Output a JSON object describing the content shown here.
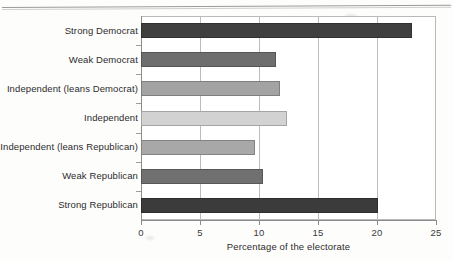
{
  "page": {
    "has_top_rule": true,
    "background_color": "#fdfdfc"
  },
  "chart_data": {
    "type": "bar",
    "orientation": "horizontal",
    "title": "",
    "subtitle": "",
    "xlabel": "Percentage of the electorate",
    "ylabel": "",
    "xlim": [
      0,
      25
    ],
    "xticks": [
      0,
      5,
      10,
      15,
      20,
      25
    ],
    "xtick_labels": [
      "0",
      "5",
      "10",
      "15",
      "20",
      "25"
    ],
    "grid": "vertical",
    "legend": "none",
    "categories": [
      "Strong Democrat",
      "Weak Democrat",
      "Independent (leans Democrat)",
      "Independent",
      "Independent (leans Republican)",
      "Weak Republican",
      "Strong Republican"
    ],
    "values": [
      23.0,
      11.4,
      11.8,
      12.4,
      9.7,
      10.3,
      20.1
    ],
    "bar_colors": [
      "#3f3f3f",
      "#6e6e6e",
      "#a3a3a3",
      "#d2d2d2",
      "#a8a8a8",
      "#707070",
      "#3b3b3b"
    ]
  },
  "axis": {
    "x_title": "Percentage of the electorate"
  }
}
